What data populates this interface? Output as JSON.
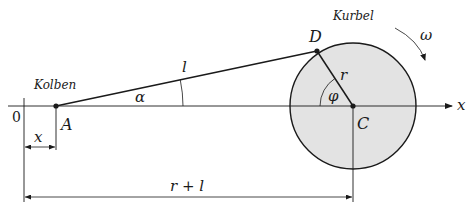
{
  "diagram": {
    "colors": {
      "line": "#1a1a1a",
      "crank_fill": "#e3e3e3",
      "background": "#ffffff"
    },
    "labels": {
      "piston": "Kolben",
      "crank": "Kurbel",
      "omega": "ω",
      "rod_length": "l",
      "alpha": "α",
      "radius": "r",
      "phi": "φ",
      "point_a": "A",
      "point_c": "C",
      "point_d": "D",
      "axis_x": "x",
      "origin": "0",
      "dim_x": "x",
      "dim_r_plus_l": "r + l"
    },
    "points": {
      "A": [
        56,
        106
      ],
      "C": [
        353,
        106
      ],
      "D": [
        317,
        51
      ]
    },
    "crank_radius_px": 63
  }
}
